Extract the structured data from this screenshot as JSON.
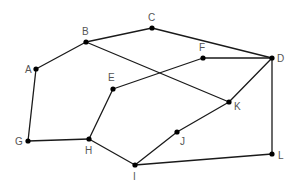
{
  "graph": {
    "nodes": [
      {
        "id": "A",
        "x": 36,
        "y": 69,
        "label_dx": -11,
        "label_dy": 4
      },
      {
        "id": "B",
        "x": 86,
        "y": 42,
        "label_dx": -4,
        "label_dy": -7
      },
      {
        "id": "C",
        "x": 152,
        "y": 28,
        "label_dx": -4,
        "label_dy": -7
      },
      {
        "id": "D",
        "x": 272,
        "y": 58,
        "label_dx": 5,
        "label_dy": 4
      },
      {
        "id": "E",
        "x": 113,
        "y": 89,
        "label_dx": -5,
        "label_dy": -8
      },
      {
        "id": "F",
        "x": 203,
        "y": 58,
        "label_dx": -4,
        "label_dy": -7
      },
      {
        "id": "G",
        "x": 28,
        "y": 141,
        "label_dx": -13,
        "label_dy": 4
      },
      {
        "id": "H",
        "x": 89,
        "y": 139,
        "label_dx": -4,
        "label_dy": 15
      },
      {
        "id": "I",
        "x": 135,
        "y": 165,
        "label_dx": -2,
        "label_dy": 15
      },
      {
        "id": "J",
        "x": 177,
        "y": 132,
        "label_dx": 3,
        "label_dy": 13
      },
      {
        "id": "K",
        "x": 229,
        "y": 102,
        "label_dx": 5,
        "label_dy": 8
      },
      {
        "id": "L",
        "x": 272,
        "y": 154,
        "label_dx": 6,
        "label_dy": 5
      }
    ],
    "edges": [
      [
        "A",
        "B"
      ],
      [
        "B",
        "C"
      ],
      [
        "C",
        "D"
      ],
      [
        "B",
        "K"
      ],
      [
        "A",
        "G"
      ],
      [
        "G",
        "H"
      ],
      [
        "H",
        "E"
      ],
      [
        "E",
        "F"
      ],
      [
        "F",
        "D"
      ],
      [
        "D",
        "K"
      ],
      [
        "D",
        "L"
      ],
      [
        "H",
        "I"
      ],
      [
        "I",
        "J"
      ],
      [
        "J",
        "K"
      ],
      [
        "I",
        "L"
      ]
    ]
  },
  "labels": {
    "A": "A",
    "B": "B",
    "C": "C",
    "D": "D",
    "E": "E",
    "F": "F",
    "G": "G",
    "H": "H",
    "I": "I",
    "J": "J",
    "K": "K",
    "L": "L"
  }
}
